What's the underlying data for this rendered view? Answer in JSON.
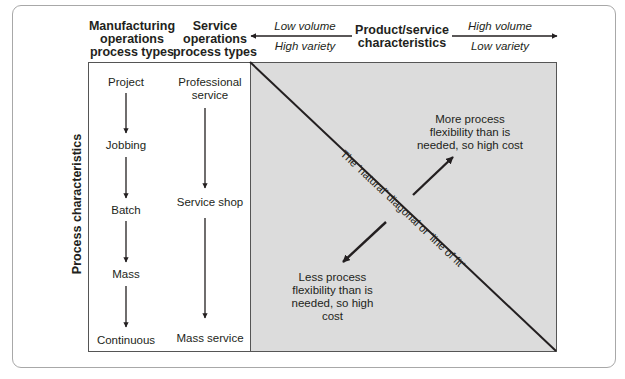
{
  "headers": {
    "manufacturing": [
      "Manufacturing",
      "operations",
      "process types"
    ],
    "service": [
      "Service",
      "operations",
      "process types"
    ],
    "product_service": [
      "Product/service",
      "characteristics"
    ]
  },
  "axis_top": {
    "left_upper": "Low volume",
    "left_lower": "High variety",
    "right_upper": "High volume",
    "right_lower": "Low variety"
  },
  "axis_left": {
    "label": "Process characteristics"
  },
  "manufacturing_types": [
    "Project",
    "Jobbing",
    "Batch",
    "Mass",
    "Continuous"
  ],
  "service_types": {
    "professional": [
      "Professional",
      "service"
    ],
    "shop": "Service shop",
    "mass": "Mass service"
  },
  "matrix": {
    "diagonal_label": "The ‘natural’ diagonal or ‘line of fit’",
    "upper_note": [
      "More process",
      "flexibility than is",
      "needed, so high cost"
    ],
    "lower_note": [
      "Less process",
      "flexibility than is",
      "needed, so high cost"
    ]
  },
  "colors": {
    "matrix_fill": "#dcdcdc",
    "line": "#231f20",
    "frame": "#a8a8a8"
  }
}
